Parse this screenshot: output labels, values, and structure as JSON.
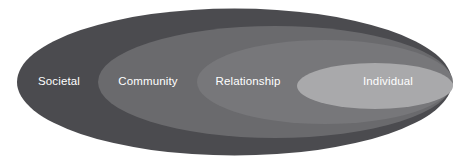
{
  "diagram": {
    "type": "nested-ellipses",
    "background_color": "#ffffff",
    "label_color": "#ffffff",
    "levels": [
      {
        "id": "societal",
        "label": "Societal",
        "color": "#4b4b4f",
        "order": 1,
        "label_x": 59,
        "label_y": 82,
        "ellipse": {
          "cx": 234.5,
          "cy": 82,
          "rx": 217.5,
          "ry": 73.5
        }
      },
      {
        "id": "community",
        "label": "Community",
        "color": "#6a6a6d",
        "order": 2,
        "label_x": 148,
        "label_y": 82,
        "ellipse": {
          "cx": 275,
          "cy": 82,
          "rx": 177,
          "ry": 56
        }
      },
      {
        "id": "relationship",
        "label": "Relationship",
        "color": "#77777a",
        "order": 3,
        "label_x": 248,
        "label_y": 82,
        "ellipse": {
          "cx": 325,
          "cy": 82,
          "rx": 128,
          "ry": 42
        }
      },
      {
        "id": "individual",
        "label": "Individual",
        "color": "#a9a9ab",
        "order": 4,
        "label_x": 388,
        "label_y": 82,
        "ellipse": {
          "cx": 375,
          "cy": 86,
          "rx": 78,
          "ry": 23
        }
      }
    ]
  }
}
